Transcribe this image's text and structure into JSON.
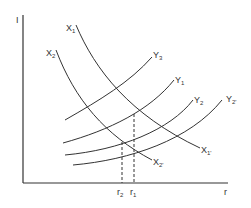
{
  "diagram": {
    "type": "economics-curve-diagram",
    "axes": {
      "y_label": "I",
      "x_label": "r"
    },
    "curves": {
      "downward": [
        {
          "id": "X1",
          "label": "X",
          "sub": "1",
          "end_label": "X",
          "end_sub": "1'",
          "role": "original"
        },
        {
          "id": "X2",
          "label": "X",
          "sub": "2",
          "end_label": "X",
          "end_sub": "2'",
          "role": "shifted"
        }
      ],
      "upward": [
        {
          "id": "Y3",
          "label": "Y",
          "sub": "3"
        },
        {
          "id": "Y1",
          "label": "Y",
          "sub": "1"
        },
        {
          "id": "Y2",
          "label": "Y",
          "sub": "2"
        },
        {
          "id": "Y2p",
          "label": "Y",
          "sub": "2'"
        }
      ]
    },
    "markers": [
      {
        "label": "r",
        "sub": "2",
        "style": "dashed"
      },
      {
        "label": "r",
        "sub": "1",
        "style": "dashed"
      }
    ],
    "colors": {
      "line": "#333333",
      "background": "#ffffff"
    }
  }
}
